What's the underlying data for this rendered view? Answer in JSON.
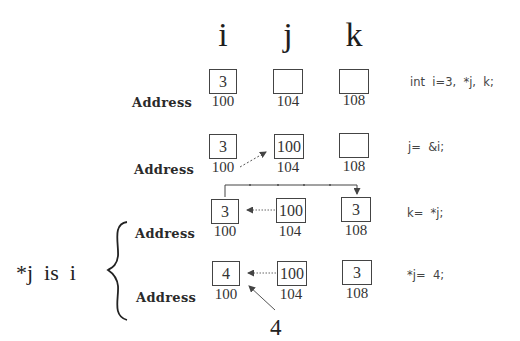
{
  "columns": [
    {
      "name": "i",
      "address": "100"
    },
    {
      "name": "j",
      "address": "104"
    },
    {
      "name": "k",
      "address": "108"
    }
  ],
  "address_label": "Address",
  "rows": [
    {
      "values": [
        "3",
        "",
        ""
      ],
      "code": "int  i=3,  *j,  k;"
    },
    {
      "values": [
        "3",
        "100",
        ""
      ],
      "code": "j=  &i;"
    },
    {
      "values": [
        "3",
        "100",
        "3"
      ],
      "code": "k=  *j;"
    },
    {
      "values": [
        "4",
        "100",
        "3"
      ],
      "code": "*j=  4;"
    }
  ],
  "side_note": "*j  is  i",
  "assigned_value": "4",
  "colors": {
    "box_border": "#444444",
    "text": "#2a2a2a",
    "arrow": "#555555"
  }
}
